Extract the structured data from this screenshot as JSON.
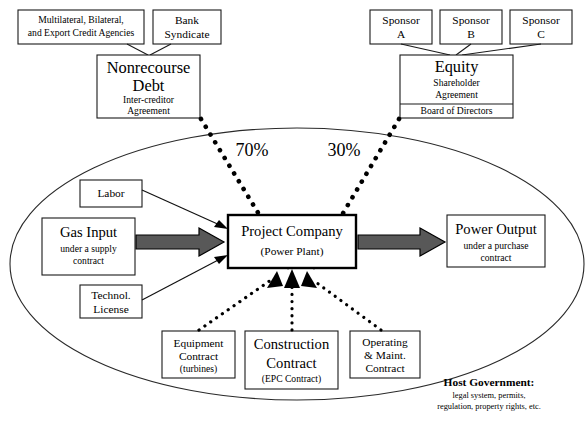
{
  "diagram": {
    "top_left": {
      "agencies_box": {
        "line1": "Multilateral, Bilateral,",
        "line2": "and Export Credit Agencies"
      },
      "bank_box": {
        "line1": "Bank",
        "line2": "Syndicate"
      },
      "debt_box": {
        "title_line1": "Nonrecourse",
        "title_line2": "Debt",
        "sub_line1": "Inter-creditor",
        "sub_line2": "Agreement"
      }
    },
    "top_right": {
      "sponsors": [
        {
          "line1": "Sponsor",
          "line2": "A"
        },
        {
          "line1": "Sponsor",
          "line2": "B"
        },
        {
          "line1": "Sponsor",
          "line2": "C"
        }
      ],
      "equity_box": {
        "title": "Equity",
        "sub_line1": "Shareholder",
        "sub_line2": "Agreement",
        "footer": "Board of Directors"
      }
    },
    "percentages": {
      "debt_share": "70%",
      "equity_share": "30%"
    },
    "center": {
      "line1": "Project Company",
      "line2": "(Power Plant)"
    },
    "inputs": {
      "labor": "Labor",
      "gas": {
        "title": "Gas Input",
        "sub_line1": "under a supply",
        "sub_line2": "contract"
      },
      "technology": {
        "line1": "Technol.",
        "line2": "License"
      }
    },
    "output": {
      "title": "Power Output",
      "sub_line1": "under a purchase",
      "sub_line2": "contract"
    },
    "contracts": [
      {
        "line1": "Equipment",
        "line2": "Contract",
        "line3": "(turbines)"
      },
      {
        "line1": "Construction",
        "line2": "Contract",
        "line3": "(EPC Contract)"
      },
      {
        "line1": "Operating",
        "line2": "& Maint.",
        "line3": "Contract"
      }
    ],
    "host_government": {
      "heading": "Host Government:",
      "sub_line1": "legal system, permits,",
      "sub_line2": "regulation, property rights, etc."
    },
    "colors": {
      "fat_arrow": "#585858",
      "outline": "#1a1a1a",
      "background": "#ffffff"
    }
  }
}
